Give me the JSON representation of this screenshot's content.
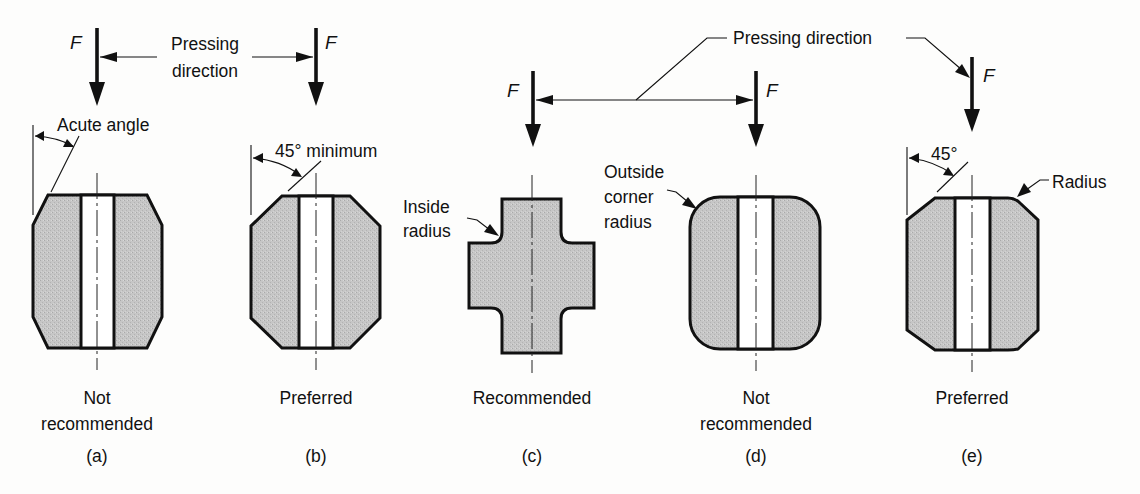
{
  "figure": {
    "force_symbol": "F",
    "colors": {
      "part_fill": "#c4c4c4",
      "stroke": "#111111",
      "background": "#fdfdfc"
    },
    "annotations": {
      "pressing_direction_stacked": [
        "Pressing",
        "direction"
      ],
      "pressing_direction": "Pressing direction",
      "acute_angle": "Acute angle",
      "min_45": "45° minimum",
      "deg_45": "45°",
      "inside_radius": [
        "Inside",
        "radius"
      ],
      "outside_corner_radius": [
        "Outside",
        "corner",
        "radius"
      ],
      "radius": "Radius"
    },
    "panels": [
      {
        "id": "a",
        "verdict": [
          "Not",
          "recommended"
        ],
        "letter": "(a)",
        "feature": "acute angle chamfer"
      },
      {
        "id": "b",
        "verdict": [
          "Preferred"
        ],
        "letter": "(b)",
        "feature": "45° minimum chamfer"
      },
      {
        "id": "c",
        "verdict": [
          "Recommended"
        ],
        "letter": "(c)",
        "feature": "inside radius"
      },
      {
        "id": "d",
        "verdict": [
          "Not",
          "recommended"
        ],
        "letter": "(d)",
        "feature": "outside corner radius"
      },
      {
        "id": "e",
        "verdict": [
          "Preferred"
        ],
        "letter": "(e)",
        "feature": "45° chamfer with radius"
      }
    ]
  }
}
